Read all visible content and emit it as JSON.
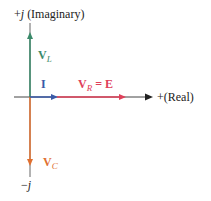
{
  "diagram": {
    "axes": {
      "imag_positive_label": {
        "sign": "+",
        "j": "j",
        "text": " (Imaginary)"
      },
      "imag_negative_label": {
        "sign": "−",
        "j": "j"
      },
      "real_positive_label": "+(Real)",
      "axis_color": "#555555"
    },
    "phasors": [
      {
        "name": "V_L",
        "main": "V",
        "sub": "L",
        "direction": "up",
        "color": "#3a8a6a"
      },
      {
        "name": "I",
        "main": "I",
        "direction": "right",
        "color": "#3a5aa8"
      },
      {
        "name": "V_R = E",
        "main": "V",
        "sub": "R",
        "eq": " = E",
        "direction": "right",
        "color": "#e0405a"
      },
      {
        "name": "V_C",
        "main": "V",
        "sub": "C",
        "direction": "down",
        "color": "#e07030"
      }
    ]
  }
}
